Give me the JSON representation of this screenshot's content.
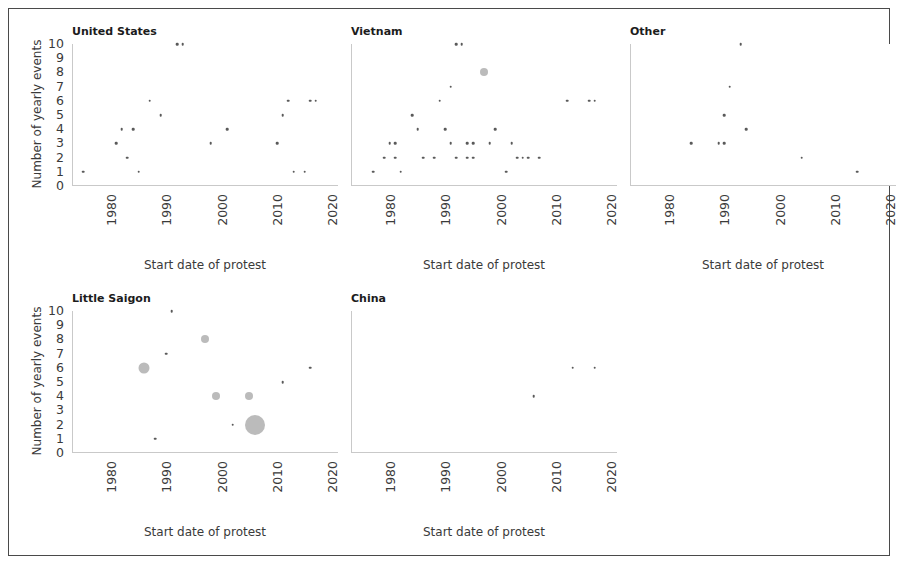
{
  "figure": {
    "y_axis_label": "Number of yearly events",
    "x_axis_label": "Start date of protest",
    "y_ticks": [
      "0",
      "1",
      "2",
      "3",
      "4",
      "5",
      "6",
      "7",
      "8",
      "9",
      "10"
    ],
    "x_ticks": [
      "1980",
      "1990",
      "2000",
      "2010",
      "2020"
    ],
    "marker_color": "#5a5a5a",
    "spine_color": "#c9c9c9",
    "title_color": "#1c1c1c"
  },
  "panels": [
    {
      "id": "united-states",
      "title": "United States"
    },
    {
      "id": "vietnam",
      "title": "Vietnam"
    },
    {
      "id": "other",
      "title": "Other"
    },
    {
      "id": "little-saigon",
      "title": "Little Saigon"
    },
    {
      "id": "china",
      "title": "China"
    }
  ],
  "chart_data": {
    "type": "scatter",
    "title": "",
    "xlabel": "Start date of protest",
    "ylabel": "Number of yearly events",
    "xlim": [
      1975,
      2023
    ],
    "ylim": [
      0,
      10
    ],
    "xticks": [
      1980,
      1990,
      2000,
      2010,
      2020
    ],
    "yticks": [
      0,
      1,
      2,
      3,
      4,
      5,
      6,
      7,
      8,
      9,
      10
    ],
    "grid": false,
    "legend": null,
    "facet_layout": {
      "rows": 2,
      "cols": 3,
      "facet_variable": "location"
    },
    "panels": [
      {
        "name": "United States",
        "points": [
          {
            "x": 1977,
            "y": 1,
            "size": 1
          },
          {
            "x": 1983,
            "y": 3,
            "size": 1
          },
          {
            "x": 1984,
            "y": 4,
            "size": 1
          },
          {
            "x": 1985,
            "y": 2,
            "size": 1
          },
          {
            "x": 1986,
            "y": 4,
            "size": 1
          },
          {
            "x": 1987,
            "y": 1,
            "size": 1
          },
          {
            "x": 1989,
            "y": 6,
            "size": 1
          },
          {
            "x": 1991,
            "y": 5,
            "size": 1
          },
          {
            "x": 1994,
            "y": 10,
            "size": 1
          },
          {
            "x": 1995,
            "y": 10,
            "size": 1
          },
          {
            "x": 2000,
            "y": 3,
            "size": 1
          },
          {
            "x": 2003,
            "y": 4,
            "size": 1
          },
          {
            "x": 2012,
            "y": 3,
            "size": 1
          },
          {
            "x": 2013,
            "y": 5,
            "size": 1
          },
          {
            "x": 2014,
            "y": 6,
            "size": 1
          },
          {
            "x": 2015,
            "y": 1,
            "size": 1
          },
          {
            "x": 2017,
            "y": 1,
            "size": 1
          },
          {
            "x": 2018,
            "y": 6,
            "size": 1
          },
          {
            "x": 2019,
            "y": 6,
            "size": 1
          }
        ]
      },
      {
        "name": "Vietnam",
        "points": [
          {
            "x": 1979,
            "y": 1,
            "size": 1
          },
          {
            "x": 1982,
            "y": 3,
            "size": 1
          },
          {
            "x": 1983,
            "y": 3,
            "size": 1
          },
          {
            "x": 1983,
            "y": 2,
            "size": 1
          },
          {
            "x": 1981,
            "y": 2,
            "size": 1
          },
          {
            "x": 1984,
            "y": 1,
            "size": 1
          },
          {
            "x": 1986,
            "y": 5,
            "size": 1
          },
          {
            "x": 1987,
            "y": 4,
            "size": 1
          },
          {
            "x": 1988,
            "y": 2,
            "size": 1
          },
          {
            "x": 1990,
            "y": 2,
            "size": 1
          },
          {
            "x": 1991,
            "y": 6,
            "size": 1
          },
          {
            "x": 1993,
            "y": 7,
            "size": 1
          },
          {
            "x": 1994,
            "y": 10,
            "size": 1
          },
          {
            "x": 1995,
            "y": 10,
            "size": 1
          },
          {
            "x": 1993,
            "y": 3,
            "size": 1
          },
          {
            "x": 1992,
            "y": 4,
            "size": 1
          },
          {
            "x": 1994,
            "y": 2,
            "size": 1
          },
          {
            "x": 1996,
            "y": 3,
            "size": 1
          },
          {
            "x": 1997,
            "y": 3,
            "size": 1
          },
          {
            "x": 1996,
            "y": 2,
            "size": 1
          },
          {
            "x": 1997,
            "y": 2,
            "size": 1
          },
          {
            "x": 1999,
            "y": 8,
            "size": 3
          },
          {
            "x": 2000,
            "y": 3,
            "size": 1
          },
          {
            "x": 2001,
            "y": 4,
            "size": 1
          },
          {
            "x": 2003,
            "y": 1,
            "size": 1
          },
          {
            "x": 2005,
            "y": 2,
            "size": 1
          },
          {
            "x": 2006,
            "y": 2,
            "size": 1
          },
          {
            "x": 2007,
            "y": 2,
            "size": 1
          },
          {
            "x": 2004,
            "y": 3,
            "size": 1
          },
          {
            "x": 2009,
            "y": 2,
            "size": 1
          },
          {
            "x": 2014,
            "y": 6,
            "size": 1
          },
          {
            "x": 2018,
            "y": 6,
            "size": 1
          },
          {
            "x": 2019,
            "y": 6,
            "size": 1
          }
        ]
      },
      {
        "name": "Other",
        "points": [
          {
            "x": 1986,
            "y": 3,
            "size": 1
          },
          {
            "x": 1991,
            "y": 3,
            "size": 1
          },
          {
            "x": 1992,
            "y": 3,
            "size": 1
          },
          {
            "x": 1992,
            "y": 5,
            "size": 1
          },
          {
            "x": 1993,
            "y": 7,
            "size": 1
          },
          {
            "x": 1995,
            "y": 10,
            "size": 1
          },
          {
            "x": 1996,
            "y": 4,
            "size": 1
          },
          {
            "x": 2006,
            "y": 2,
            "size": 1
          },
          {
            "x": 2016,
            "y": 1,
            "size": 1
          }
        ]
      },
      {
        "name": "Little Saigon",
        "points": [
          {
            "x": 1988,
            "y": 6,
            "size": 4
          },
          {
            "x": 1990,
            "y": 1,
            "size": 1
          },
          {
            "x": 1993,
            "y": 10,
            "size": 1
          },
          {
            "x": 1992,
            "y": 7,
            "size": 1
          },
          {
            "x": 1999,
            "y": 8,
            "size": 3
          },
          {
            "x": 2001,
            "y": 4,
            "size": 3
          },
          {
            "x": 2004,
            "y": 2,
            "size": 1
          },
          {
            "x": 2007,
            "y": 4,
            "size": 3
          },
          {
            "x": 2008,
            "y": 2,
            "size": 6
          },
          {
            "x": 2013,
            "y": 5,
            "size": 1
          },
          {
            "x": 2018,
            "y": 6,
            "size": 1
          }
        ]
      },
      {
        "name": "China",
        "points": [
          {
            "x": 2008,
            "y": 4,
            "size": 1
          },
          {
            "x": 2015,
            "y": 6,
            "size": 1
          },
          {
            "x": 2019,
            "y": 6,
            "size": 1
          }
        ]
      }
    ]
  }
}
